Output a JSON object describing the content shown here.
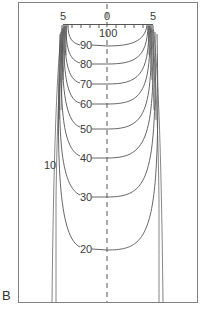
{
  "figure": {
    "panel_label": "B",
    "type": "isodose contour diagram",
    "ruler": {
      "left_label": "5",
      "center_label": "0",
      "right_label": "5"
    },
    "contours": [
      {
        "label": "100"
      },
      {
        "label": "90"
      },
      {
        "label": "80"
      },
      {
        "label": "70"
      },
      {
        "label": "60"
      },
      {
        "label": "50"
      },
      {
        "label": "40"
      },
      {
        "label": "30"
      },
      {
        "label": "20"
      },
      {
        "label": "10"
      }
    ],
    "colors": {
      "line": "#555555",
      "frame": "#777777",
      "text": "#3a3a3a"
    }
  }
}
